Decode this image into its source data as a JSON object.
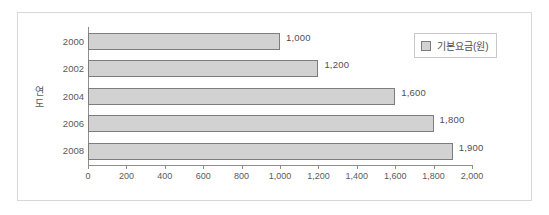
{
  "chart_data": {
    "type": "bar",
    "orientation": "horizontal",
    "title": "",
    "xlabel": "",
    "ylabel": "연도",
    "categories": [
      "2000",
      "2002",
      "2004",
      "2006",
      "2008"
    ],
    "values": [
      1000,
      1200,
      1600,
      1800,
      1900
    ],
    "data_labels": [
      "1,000",
      "1,200",
      "1,600",
      "1,800",
      "1,900"
    ],
    "series": [
      {
        "name": "기본요금(원)",
        "values": [
          1000,
          1200,
          1600,
          1800,
          1900
        ],
        "color": "#d2d2d2",
        "border_color": "#7d7d7d"
      }
    ],
    "xlim": [
      0,
      2000
    ],
    "xticks": [
      0,
      200,
      400,
      600,
      800,
      1000,
      1200,
      1400,
      1600,
      1800,
      2000
    ],
    "xtick_labels": [
      "0",
      "200",
      "400",
      "600",
      "800",
      "1,000",
      "1,200",
      "1,400",
      "1,600",
      "1,800",
      "2,000"
    ],
    "grid": false,
    "legend": {
      "position": "top-right",
      "entries": [
        {
          "label": "기본요금(원)",
          "swatch_color": "#d2d2d2"
        }
      ]
    }
  },
  "axis_title": {
    "y_char_1": "연",
    "y_char_2": "도"
  },
  "colors": {
    "bar_fill": "#d2d2d2",
    "bar_border": "#7d7d7d",
    "axis_line": "#8e8e8e",
    "frame": "#d8d8d8",
    "text": "#5a5a5a",
    "background": "#ffffff"
  }
}
